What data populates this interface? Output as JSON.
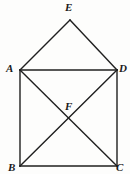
{
  "figure": {
    "type": "geometry-diagram",
    "background_color": "#fdfdfc",
    "stroke_color": "#1f1f1f",
    "stroke_width": 1.4,
    "label_color": "#1a1a1a",
    "points": [
      {
        "id": "A",
        "label": "A",
        "x": 20,
        "y": 70,
        "label_x": 6,
        "label_y": 63
      },
      {
        "id": "D",
        "label": "D",
        "x": 117,
        "y": 70,
        "label_x": 119,
        "label_y": 63
      },
      {
        "id": "B",
        "label": "B",
        "x": 20,
        "y": 166,
        "label_x": 8,
        "label_y": 162
      },
      {
        "id": "C",
        "label": "C",
        "x": 117,
        "y": 166,
        "label_x": 116,
        "label_y": 162
      },
      {
        "id": "E",
        "label": "E",
        "x": 70,
        "y": 20,
        "label_x": 65,
        "label_y": 2
      },
      {
        "id": "F",
        "label": "F",
        "x": 69,
        "y": 118,
        "label_x": 65,
        "label_y": 101
      }
    ],
    "segments": [
      {
        "name": "AD",
        "from": "A",
        "to": "D"
      },
      {
        "name": "AB",
        "from": "A",
        "to": "B"
      },
      {
        "name": "DC",
        "from": "D",
        "to": "C"
      },
      {
        "name": "BC",
        "from": "B",
        "to": "C"
      },
      {
        "name": "AC",
        "from": "A",
        "to": "C"
      },
      {
        "name": "BD",
        "from": "B",
        "to": "D"
      },
      {
        "name": "AE",
        "from": "A",
        "to": "E"
      },
      {
        "name": "ED",
        "from": "E",
        "to": "D"
      }
    ]
  }
}
